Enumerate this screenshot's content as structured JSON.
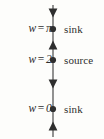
{
  "figure": {
    "type": "phase-line-diagram",
    "axis": {
      "orientation": "vertical",
      "x": 53,
      "y_top": 5,
      "y_bottom": 137,
      "color": "#4a4a4a",
      "stroke_width": 1.2
    },
    "equilibria": [
      {
        "name": "w-equals-pi",
        "variable": "w",
        "relation": "=",
        "value": "π",
        "classification": "sink",
        "y": 29
      },
      {
        "name": "w-equals-2",
        "variable": "w",
        "relation": "=",
        "value": "2",
        "classification": "source",
        "y": 60
      },
      {
        "name": "w-equals-0",
        "variable": "w",
        "relation": "=",
        "value": "0",
        "classification": "sink",
        "y": 109
      }
    ],
    "flow_arrows": [
      {
        "name": "arrow-above-pi",
        "direction": "down",
        "y": 13
      },
      {
        "name": "arrow-between-2-and-pi",
        "direction": "up",
        "y": 45
      },
      {
        "name": "arrow-between-0-and-2",
        "direction": "down",
        "y": 84
      },
      {
        "name": "arrow-below-0",
        "direction": "up",
        "y": 126
      }
    ],
    "colors": {
      "line": "#4a4a4a",
      "dot": "#2e2e2e",
      "arrow": "#2e2e2e",
      "text": "#2e2e2e",
      "background": "#fdfdfb"
    }
  }
}
